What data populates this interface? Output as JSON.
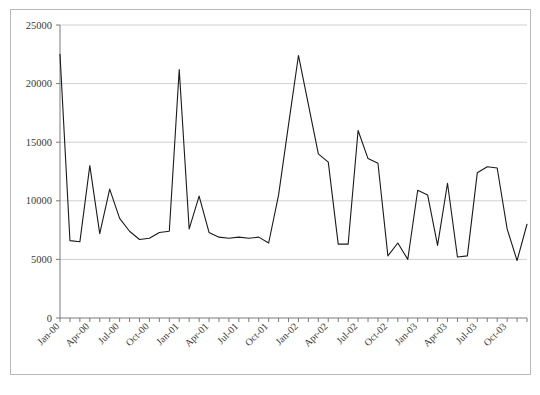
{
  "document": {
    "clipped_header_text": "",
    "background_color": "#ffffff",
    "frame_color": "#b9b9b9"
  },
  "chart_data": {
    "type": "line",
    "title": "",
    "subtitle": "",
    "xlabel": "",
    "ylabel": "",
    "ylim": [
      0,
      25000
    ],
    "ytick_values": [
      0,
      5000,
      10000,
      15000,
      20000,
      25000
    ],
    "ytick_labels": [
      "0",
      "5000",
      "10000",
      "15000",
      "20000",
      "25000"
    ],
    "grid": true,
    "grid_axis": "y",
    "grid_color": "#d0d0d0",
    "legend": false,
    "legend_position": "none",
    "line_color": "#1a1a1a",
    "line_width": 1.1,
    "markers": false,
    "x_tick_interval": "monthly",
    "x_label_interval": "quarterly",
    "xtick_labels": [
      "Jan-00",
      "Apr-00",
      "Jul-00",
      "Oct-00",
      "Jan-01",
      "Apr-01",
      "Jul-01",
      "Oct-01",
      "Jan-02",
      "Apr-02",
      "Jul-02",
      "Oct-02",
      "Jan-03",
      "Apr-03",
      "Jul-03",
      "Oct-03"
    ],
    "x": [
      "Jan-00",
      "Feb-00",
      "Mar-00",
      "Apr-00",
      "May-00",
      "Jun-00",
      "Jul-00",
      "Aug-00",
      "Sep-00",
      "Oct-00",
      "Nov-00",
      "Dec-00",
      "Jan-01",
      "Feb-01",
      "Mar-01",
      "Apr-01",
      "May-01",
      "Jun-01",
      "Jul-01",
      "Aug-01",
      "Sep-01",
      "Oct-01",
      "Nov-01",
      "Dec-01",
      "Jan-02",
      "Feb-02",
      "Mar-02",
      "Apr-02",
      "May-02",
      "Jun-02",
      "Jul-02",
      "Aug-02",
      "Sep-02",
      "Oct-02",
      "Nov-02",
      "Dec-02",
      "Jan-03",
      "Feb-03",
      "Mar-03",
      "Apr-03",
      "May-03",
      "Jun-03",
      "Jul-03",
      "Aug-03",
      "Sep-03",
      "Oct-03",
      "Nov-03"
    ],
    "values": [
      22500,
      6600,
      6500,
      13000,
      7200,
      11000,
      8500,
      7400,
      6700,
      6800,
      7300,
      7400,
      21200,
      7600,
      10400,
      7300,
      6900,
      6800,
      6900,
      6800,
      6900,
      6400,
      10500,
      16500,
      22400,
      18200,
      14000,
      13300,
      6300,
      6300,
      16000,
      13600,
      13200,
      5300,
      6400,
      5000,
      10900,
      10500,
      6200,
      11500,
      5200,
      5300,
      12400,
      12900,
      12800,
      7600,
      4900
    ],
    "final_point_value": 8000,
    "series_name": ""
  }
}
